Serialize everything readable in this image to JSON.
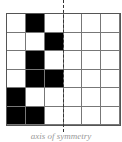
{
  "figure": {
    "rows": 6,
    "cols": 6,
    "filled_cells": [
      [
        0,
        1
      ],
      [
        1,
        2
      ],
      [
        2,
        1
      ],
      [
        3,
        1
      ],
      [
        3,
        2
      ],
      [
        4,
        0
      ],
      [
        5,
        0
      ],
      [
        5,
        1
      ]
    ],
    "axis": {
      "type": "dashed-vertical",
      "between_cols": [
        2,
        3
      ]
    },
    "caption": "axis of symmetry"
  }
}
